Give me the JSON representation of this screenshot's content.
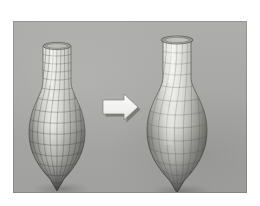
{
  "figure": {
    "caption": "",
    "domain_note": "Grayscale 3D mesh figure: coarse quad-mesh vase transformed into a smoothed vase",
    "page_background": "#ffffff",
    "panel": {
      "name": "render-panel",
      "x": 13,
      "y": 21,
      "width": 234,
      "height": 172,
      "background_color": "#a9a9a7",
      "edge_color": "#8f8f8d"
    },
    "objects": [
      {
        "id": "left-vase",
        "label": "coarse quad-mesh vase",
        "state": "before",
        "center_x": 57,
        "rim_y": 44,
        "tip_y": 170,
        "surface_color": "#d2d2cf",
        "wireframe_color": "#3a3a38",
        "shadow_color": "#8b8b88",
        "mesh_columns": 14,
        "mesh_rows": 16,
        "description": "Cylindrical neck flaring into a bulbous body that tapers to a sharp point; dense visible quadrilateral wireframe."
      },
      {
        "id": "right-vase",
        "label": "smoothed / faired vase",
        "state": "after",
        "center_x": 177,
        "rim_y": 39,
        "tip_y": 172,
        "surface_color": "#d8d8d4",
        "wireframe_color": "#4a4a47",
        "shadow_color": "#8b8b88",
        "mesh_columns": 12,
        "mesh_rows": 12,
        "description": "Same topology with a wider, smoother bulb and softer highlights; sparser wireframe."
      }
    ],
    "arrow": {
      "id": "transform-arrow",
      "label": "transformation arrow",
      "direction": "right",
      "x": 100,
      "y": 95,
      "width": 36,
      "height": 24,
      "fill_color": "#f8f8f6",
      "outline_color": "#6e6e6b",
      "shadow_color": "#5d5d5a"
    }
  }
}
